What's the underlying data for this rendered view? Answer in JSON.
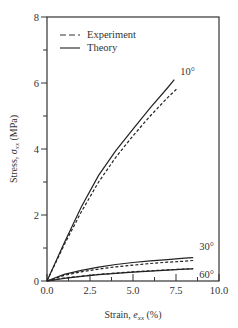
{
  "chart_data": {
    "type": "line",
    "title": "",
    "xlabel": "Strain, e_xx (%)",
    "xlabel_main": "Strain, ",
    "xlabel_var": "e",
    "xlabel_sub": "xx",
    "xlabel_unit": " (%)",
    "ylabel": "Stress, σ_xx (MPa)",
    "ylabel_main": "Stress, ",
    "ylabel_var": "σ",
    "ylabel_sub": "xx",
    "ylabel_unit": " (MPa)",
    "xlim": [
      0,
      10
    ],
    "ylim": [
      0,
      8
    ],
    "x_ticks": [
      "0.0",
      "2.5",
      "5.0",
      "7.5",
      "10.0"
    ],
    "y_ticks": [
      "0",
      "2",
      "4",
      "6",
      "8"
    ],
    "grid": false,
    "legend_position": "upper left",
    "legend": [
      {
        "label": "Experiment",
        "style": "dashed"
      },
      {
        "label": "Theory",
        "style": "solid"
      }
    ],
    "series": [
      {
        "name": "10° Theory",
        "angle": "10°",
        "style": "solid",
        "x": [
          0,
          1,
          2,
          3,
          4,
          5,
          6,
          7,
          7.4
        ],
        "y": [
          0,
          1.15,
          2.25,
          3.2,
          3.95,
          4.6,
          5.25,
          5.85,
          6.1
        ]
      },
      {
        "name": "10° Experiment",
        "angle": "10°",
        "style": "dashed",
        "x": [
          0,
          1,
          2,
          3,
          4,
          5,
          6,
          7,
          7.6
        ],
        "y": [
          0,
          1.1,
          2.1,
          3.0,
          3.75,
          4.4,
          5.0,
          5.55,
          5.85
        ]
      },
      {
        "name": "30° Theory",
        "angle": "30°",
        "style": "solid",
        "x": [
          0,
          1,
          2,
          3,
          4,
          5,
          6,
          7,
          8,
          8.5
        ],
        "y": [
          0,
          0.2,
          0.32,
          0.42,
          0.5,
          0.56,
          0.61,
          0.65,
          0.69,
          0.71
        ]
      },
      {
        "name": "30° Experiment",
        "angle": "30°",
        "style": "dashed",
        "x": [
          0,
          1,
          2,
          3,
          4,
          5,
          6,
          7,
          8,
          8.5
        ],
        "y": [
          0,
          0.17,
          0.28,
          0.36,
          0.43,
          0.48,
          0.53,
          0.57,
          0.6,
          0.62
        ]
      },
      {
        "name": "60° Theory",
        "angle": "60°",
        "style": "solid",
        "x": [
          0,
          1,
          2,
          3,
          4,
          5,
          6,
          7,
          8,
          8.5
        ],
        "y": [
          0,
          0.08,
          0.14,
          0.19,
          0.23,
          0.27,
          0.3,
          0.33,
          0.36,
          0.37
        ]
      },
      {
        "name": "60° Experiment",
        "angle": "60°",
        "style": "dashed",
        "x": [
          0,
          1,
          2,
          3,
          4,
          5,
          6,
          7,
          8,
          8.5
        ],
        "y": [
          0,
          0.09,
          0.15,
          0.2,
          0.24,
          0.28,
          0.31,
          0.34,
          0.36,
          0.38
        ]
      }
    ],
    "annotations": [
      "10°",
      "30°",
      "60°"
    ]
  }
}
